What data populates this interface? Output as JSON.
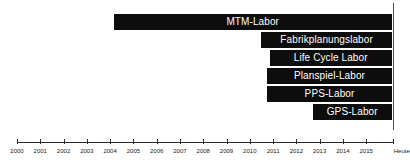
{
  "chart_data": {
    "type": "bar",
    "orientation": "horizontal",
    "subtype": "gantt-timeline",
    "title": "",
    "subtitle": "",
    "xlabel": "",
    "ylabel": "",
    "grid": false,
    "legend": "none",
    "xlim": [
      2000,
      2016.1
    ],
    "categories": [
      "MTM-Labor",
      "Fabrikplanungslabor",
      "Life Cycle Labor",
      "Planspiel-Labor",
      "PPS-Labor",
      "GPS-Labor"
    ],
    "tick_labels": [
      "2000",
      "2001",
      "2002",
      "2003",
      "2004",
      "2005",
      "2006",
      "2007",
      "2008",
      "2009",
      "2010",
      "2011",
      "2012",
      "2013",
      "2014",
      "2015"
    ],
    "tick_values": [
      2000,
      2001,
      2002,
      2003,
      2004,
      2005,
      2006,
      2007,
      2008,
      2009,
      2010,
      2011,
      2012,
      2013,
      2014,
      2015
    ],
    "today_label": "Heute",
    "today_value": 2016.1,
    "bar_color": "#0d0d0d",
    "bar_text_color": "#ffffff",
    "axis_color": "#2b2b2b",
    "bars": [
      {
        "label": "MTM-Labor",
        "start": 2004.15,
        "end": 2016.1
      },
      {
        "label": "Fabrikplanungslabor",
        "start": 2010.5,
        "end": 2016.1
      },
      {
        "label": "Life Cycle Labor",
        "start": 2010.85,
        "end": 2016.1
      },
      {
        "label": "Planspiel-Labor",
        "start": 2010.75,
        "end": 2016.1
      },
      {
        "label": "PPS-Labor",
        "start": 2010.75,
        "end": 2016.1
      },
      {
        "label": "GPS-Labor",
        "start": 2012.7,
        "end": 2016.1
      }
    ]
  }
}
